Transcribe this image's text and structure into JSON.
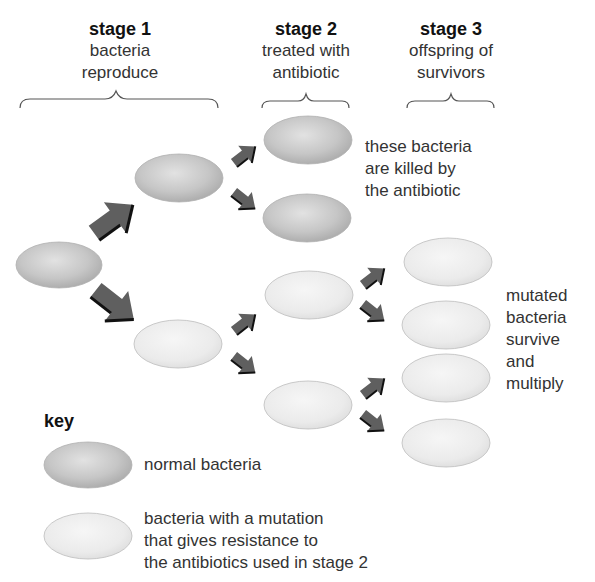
{
  "stages": [
    {
      "title": "stage 1",
      "line1": "bacteria",
      "line2": "reproduce"
    },
    {
      "title": "stage 2",
      "line1": "treated with",
      "line2": "antibiotic"
    },
    {
      "title": "stage 3",
      "line1": "offspring of",
      "line2": "survivors"
    }
  ],
  "annotations": {
    "killed": [
      "these bacteria",
      "are killed by",
      "the antibiotic"
    ],
    "survive": [
      "mutated",
      "bacteria",
      "survive",
      "and",
      "multiply"
    ]
  },
  "key": {
    "title": "key",
    "normal_label": "normal bacteria",
    "mutated_label": [
      "bacteria with a mutation",
      "that gives resistance to",
      "the antibiotics used in stage 2"
    ]
  },
  "colors": {
    "normal_fill": "#c4c4c4",
    "mutated_fill": "#ececec",
    "arrow": "#5f5f5f",
    "arrow_shadow": "#111111",
    "brace": "#555555"
  }
}
